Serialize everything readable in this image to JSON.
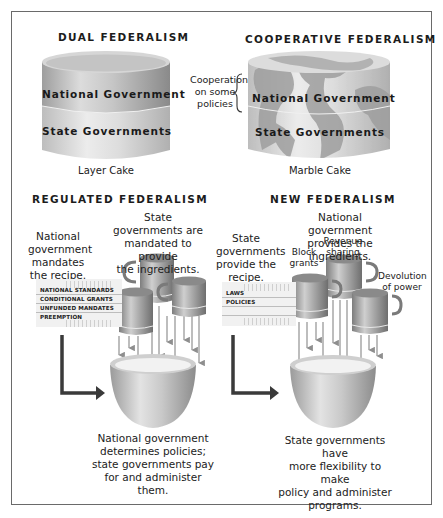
{
  "diagram": {
    "type": "federalism-models-comparison",
    "panels": {
      "dual": {
        "title": "DUAL FEDERALISM",
        "cake": {
          "top_layer": "National Government",
          "bottom_layer": "State Governments"
        },
        "caption": "Layer Cake"
      },
      "cooperative": {
        "title": "COOPERATIVE FEDERALISM",
        "annotation": [
          "Cooperation",
          "on some",
          "policies"
        ],
        "cake": {
          "top_layer": "National Government",
          "bottom_layer": "State Governments"
        },
        "caption": "Marble Cake"
      },
      "regulated": {
        "title": "REGULATED FEDERALISM",
        "recipe_label": [
          "National",
          "government",
          "mandates",
          "the recipe."
        ],
        "ingredients_label": [
          "State governments are",
          "mandated to provide",
          "the ingredients."
        ],
        "recipe_items": [
          "NATIONAL STANDARDS",
          "CONDITIONAL GRANTS",
          "UNFUNDED MANDATES",
          "PREEMPTION"
        ],
        "result": [
          "National government",
          "determines policies;",
          "state governments pay",
          "for and administer",
          "them."
        ]
      },
      "new": {
        "title": "NEW FEDERALISM",
        "recipe_label": [
          "State",
          "governments",
          "provide the",
          "recipe."
        ],
        "ingredients_label": [
          "National government",
          "provides the ingredients."
        ],
        "recipe_items": [
          "LAWS",
          "POLICIES"
        ],
        "cups": [
          {
            "label": [
              "Block",
              "grants"
            ]
          },
          {
            "label": [
              "Revenue",
              "sharing"
            ]
          },
          {
            "label": [
              "Devolution",
              "of power"
            ]
          }
        ],
        "result": [
          "State governments have",
          "more flexibility to make",
          "policy and administer",
          "programs."
        ]
      }
    },
    "colors": {
      "border": "#6a6a6a",
      "arrow_dark": "#3a3a3a",
      "arrow_light": "#9a9a9a",
      "cake_gray": "#b9b9b9",
      "marble_dark": "#9c9c9c"
    }
  }
}
